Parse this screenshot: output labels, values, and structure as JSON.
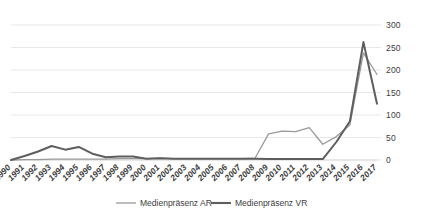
{
  "chart_data": {
    "type": "line",
    "title": "",
    "subtitle": "",
    "xlabel": "",
    "ylabel": "",
    "ylim": [
      0,
      300
    ],
    "ytick_step": 50,
    "yticks": [
      "0",
      "50",
      "100",
      "150",
      "200",
      "250",
      "300"
    ],
    "grid": true,
    "legend_position": "bottom",
    "categories": [
      "1990",
      "1991",
      "1992",
      "1993",
      "1994",
      "1995",
      "1996",
      "1997",
      "1998",
      "1999",
      "2000",
      "2001",
      "2002",
      "2003",
      "2004",
      "2005",
      "2006",
      "2007",
      "2008",
      "2009",
      "2010",
      "2011",
      "2012",
      "2013",
      "2014",
      "2015",
      "2016",
      "2017"
    ],
    "series": [
      {
        "name": "Medienpräsenz AR",
        "color": "#9a9a9a",
        "values": [
          0,
          1,
          1,
          2,
          2,
          2,
          2,
          2,
          3,
          3,
          3,
          4,
          3,
          3,
          3,
          3,
          3,
          3,
          4,
          58,
          64,
          63,
          72,
          35,
          52,
          78,
          238,
          190
        ]
      },
      {
        "name": "Medienpräsenz VR",
        "color": "#5e5e5e",
        "values": [
          0,
          9,
          19,
          31,
          23,
          29,
          14,
          6,
          8,
          8,
          3,
          4,
          3,
          3,
          3,
          3,
          3,
          3,
          3,
          2,
          2,
          2,
          2,
          2,
          40,
          86,
          262,
          125
        ]
      }
    ]
  },
  "legend": {
    "items": [
      {
        "label": "Medienpräsenz AR",
        "color": "#9a9a9a",
        "width": 1.3
      },
      {
        "label": "Medienpräsenz VR",
        "color": "#5e5e5e",
        "width": 2.1
      }
    ]
  }
}
